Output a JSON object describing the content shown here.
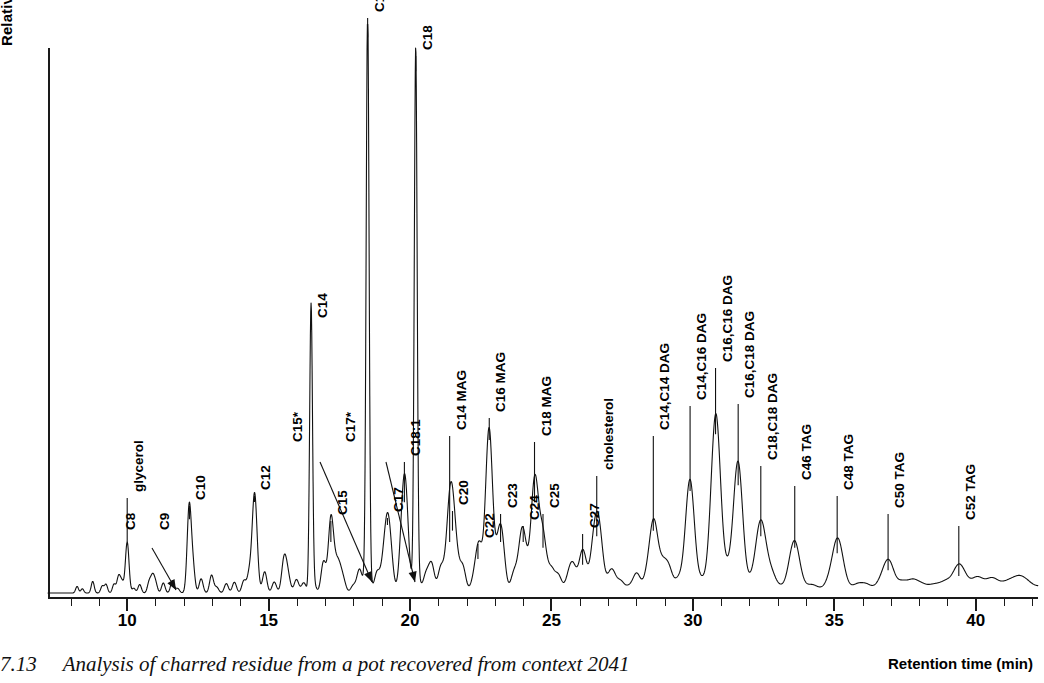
{
  "figure": {
    "caption_number": "7.13",
    "caption_text": "Analysis of charred residue from a pot recovered from context 2041"
  },
  "axes": {
    "y_title": "Relative intensity",
    "x_title": "Retention time (min)",
    "x_tick_labels": [
      "10",
      "15",
      "20",
      "25",
      "30",
      "35",
      "40"
    ]
  },
  "chart_data": {
    "type": "line",
    "title": "Analysis of charred residue from a pot recovered from context 2041",
    "xlabel": "Retention time (min)",
    "ylabel": "Relative intensity",
    "xlim": [
      7.2,
      42.2
    ],
    "ylim": [
      0,
      100
    ],
    "grid": false,
    "legend": "none",
    "x_ticks": [
      10,
      15,
      20,
      25,
      30,
      35,
      40
    ],
    "x_minor_tick_interval": 1,
    "y_ticks": [],
    "series_name": "Total ion chromatogram",
    "annotations": [
      {
        "label": "C8",
        "rt": 9.7,
        "height": 3,
        "leader": "arrow"
      },
      {
        "label": "glycerol",
        "rt": 10.0,
        "height": 9,
        "leader": "line"
      },
      {
        "label": "C9",
        "rt": 10.9,
        "height": 3,
        "leader": "none"
      },
      {
        "label": "C10",
        "rt": 12.2,
        "height": 13,
        "leader": "line"
      },
      {
        "label": "C12",
        "rt": 14.5,
        "height": 17,
        "leader": "line"
      },
      {
        "label": "C15*",
        "rt": 15.6,
        "height": 4,
        "leader": "arrow"
      },
      {
        "label": "C14",
        "rt": 16.5,
        "height": 50,
        "leader": "line"
      },
      {
        "label": "C15",
        "rt": 17.2,
        "height": 9,
        "leader": "line"
      },
      {
        "label": "C17*",
        "rt": 17.5,
        "height": 4,
        "leader": "arrow"
      },
      {
        "label": "C16",
        "rt": 18.5,
        "height": 98,
        "leader": "line"
      },
      {
        "label": "C17",
        "rt": 19.2,
        "height": 12,
        "leader": "line"
      },
      {
        "label": "C18:1",
        "rt": 19.8,
        "height": 16,
        "leader": "line"
      },
      {
        "label": "C18",
        "rt": 20.2,
        "height": 92,
        "leader": "line"
      },
      {
        "label": "C20",
        "rt": 21.5,
        "height": 11,
        "leader": "line"
      },
      {
        "label": "C14 MAG",
        "rt": 21.4,
        "height": 9,
        "leader": "line"
      },
      {
        "label": "C22",
        "rt": 22.4,
        "height": 6,
        "leader": "line"
      },
      {
        "label": "C16 MAG",
        "rt": 22.8,
        "height": 27,
        "leader": "line"
      },
      {
        "label": "C23",
        "rt": 23.2,
        "height": 9,
        "leader": "line"
      },
      {
        "label": "C24",
        "rt": 24.0,
        "height": 9,
        "leader": "line"
      },
      {
        "label": "C18 MAG",
        "rt": 24.4,
        "height": 16,
        "leader": "line"
      },
      {
        "label": "C25",
        "rt": 24.7,
        "height": 8,
        "leader": "line"
      },
      {
        "label": "C27",
        "rt": 26.1,
        "height": 5,
        "leader": "line"
      },
      {
        "label": "cholesterol",
        "rt": 26.6,
        "height": 10,
        "leader": "line"
      },
      {
        "label": "C14,C14 DAG",
        "rt": 28.6,
        "height": 11,
        "leader": "line"
      },
      {
        "label": "C14,C16 DAG",
        "rt": 29.9,
        "height": 18,
        "leader": "line"
      },
      {
        "label": "C16,C16 DAG",
        "rt": 30.8,
        "height": 28,
        "leader": "line"
      },
      {
        "label": "C16,C18 DAG",
        "rt": 31.6,
        "height": 19,
        "leader": "line"
      },
      {
        "label": "C18,C18 DAG",
        "rt": 32.4,
        "height": 10,
        "leader": "line"
      },
      {
        "label": "C46 TAG",
        "rt": 33.6,
        "height": 8,
        "leader": "line"
      },
      {
        "label": "C48 TAG",
        "rt": 35.1,
        "height": 7,
        "leader": "line"
      },
      {
        "label": "C50 TAG",
        "rt": 36.9,
        "height": 4,
        "leader": "line"
      },
      {
        "label": "C52 TAG",
        "rt": 39.4,
        "height": 3,
        "leader": "line"
      }
    ],
    "major_peaks": [
      {
        "rt": 9.7,
        "height": 3,
        "name": "C8"
      },
      {
        "rt": 10.0,
        "height": 9,
        "name": "glycerol"
      },
      {
        "rt": 10.9,
        "height": 3,
        "name": "C9"
      },
      {
        "rt": 12.2,
        "height": 13,
        "name": "C10"
      },
      {
        "rt": 14.5,
        "height": 17,
        "name": "C12"
      },
      {
        "rt": 15.6,
        "height": 4,
        "name": "C15*"
      },
      {
        "rt": 16.5,
        "height": 50,
        "name": "C14"
      },
      {
        "rt": 17.2,
        "height": 9,
        "name": "C15"
      },
      {
        "rt": 17.5,
        "height": 4,
        "name": "C17*"
      },
      {
        "rt": 18.5,
        "height": 98,
        "name": "C16"
      },
      {
        "rt": 19.2,
        "height": 12,
        "name": "C17"
      },
      {
        "rt": 19.8,
        "height": 16,
        "name": "C18:1"
      },
      {
        "rt": 20.2,
        "height": 92,
        "name": "C18"
      },
      {
        "rt": 21.4,
        "height": 9,
        "name": "C14 MAG"
      },
      {
        "rt": 21.5,
        "height": 11,
        "name": "C20"
      },
      {
        "rt": 22.4,
        "height": 6,
        "name": "C22"
      },
      {
        "rt": 22.8,
        "height": 27,
        "name": "C16 MAG"
      },
      {
        "rt": 23.2,
        "height": 9,
        "name": "C23"
      },
      {
        "rt": 24.0,
        "height": 9,
        "name": "C24"
      },
      {
        "rt": 24.4,
        "height": 16,
        "name": "C18 MAG"
      },
      {
        "rt": 24.7,
        "height": 8,
        "name": "C25"
      },
      {
        "rt": 26.1,
        "height": 5,
        "name": "C27"
      },
      {
        "rt": 26.6,
        "height": 10,
        "name": "cholesterol"
      },
      {
        "rt": 28.6,
        "height": 11,
        "name": "C14,C14 DAG"
      },
      {
        "rt": 29.9,
        "height": 18,
        "name": "C14,C16 DAG"
      },
      {
        "rt": 30.8,
        "height": 28,
        "name": "C16,C16 DAG"
      },
      {
        "rt": 31.6,
        "height": 19,
        "name": "C16,C18 DAG"
      },
      {
        "rt": 32.4,
        "height": 10,
        "name": "C18,C18 DAG"
      },
      {
        "rt": 33.6,
        "height": 8,
        "name": "C46 TAG"
      },
      {
        "rt": 35.1,
        "height": 7,
        "name": "C48 TAG"
      },
      {
        "rt": 36.9,
        "height": 4,
        "name": "C50 TAG"
      },
      {
        "rt": 39.4,
        "height": 3,
        "name": "C52 TAG"
      }
    ]
  }
}
